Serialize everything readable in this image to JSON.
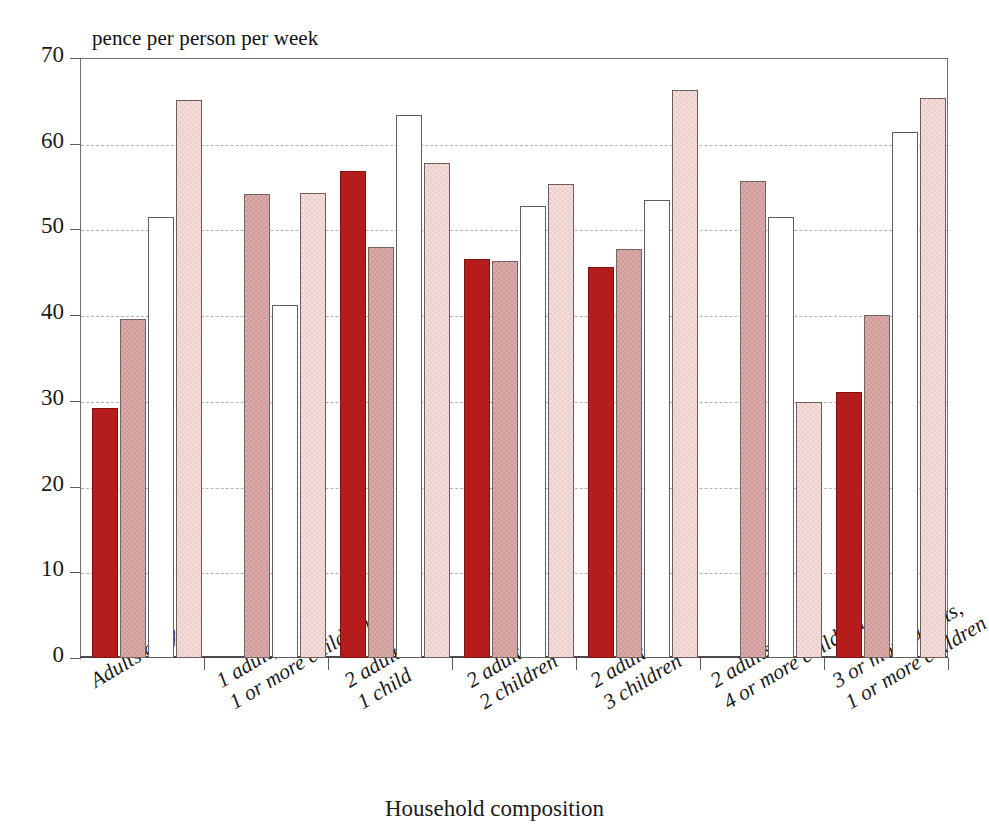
{
  "chart_data": {
    "type": "bar",
    "title": "",
    "ylabel": "pence per person per week",
    "xlabel": "Household composition",
    "ylim": [
      0,
      70
    ],
    "ytick_step": 10,
    "ytick_labels": [
      "70",
      "60",
      "50",
      "40",
      "30",
      "20",
      "10",
      "0"
    ],
    "ytick_values": [
      70,
      60,
      50,
      40,
      30,
      20,
      10,
      0
    ],
    "grid": "horizontal-dashed",
    "legend_position": "none",
    "legend_entries": [],
    "categories": [
      "Adults only",
      "1 adult,\n1 or more children",
      "2 adults,\n1 child",
      "2 adults,\n2 children",
      "2 adults,\n3 children",
      "2 adults,\n4 or more children",
      "3 or more adults,\n1 or more children"
    ],
    "category_lines": [
      [
        "Adults only"
      ],
      [
        "1 adult,",
        "1 or more children"
      ],
      [
        "2 adults,",
        "1 child"
      ],
      [
        "2 adults,",
        "2 children"
      ],
      [
        "2 adults,",
        "3 children"
      ],
      [
        "2 adults,",
        "4 or more children"
      ],
      [
        "3 or more adults,",
        "1 or more children"
      ]
    ],
    "series": [
      {
        "name": "series-1",
        "color": "#b51d1d",
        "fill": "solid-dark-red",
        "values": [
          29.2,
          null,
          56.8,
          46.5,
          45.6,
          null,
          31.0
        ]
      },
      {
        "name": "series-2",
        "color": "#cf9b99",
        "fill": "hatched-rose",
        "values": [
          39.5,
          54.1,
          48.0,
          46.3,
          47.7,
          55.6,
          40.0
        ]
      },
      {
        "name": "series-3",
        "color": "#ffffff",
        "fill": "white-outline",
        "values": [
          51.4,
          41.2,
          63.4,
          52.7,
          53.4,
          51.4,
          61.4
        ]
      },
      {
        "name": "series-4",
        "color": "#f3dedb",
        "fill": "hatched-light-pink",
        "values": [
          65.1,
          54.3,
          57.8,
          55.3,
          66.3,
          29.9,
          65.3
        ]
      }
    ]
  }
}
